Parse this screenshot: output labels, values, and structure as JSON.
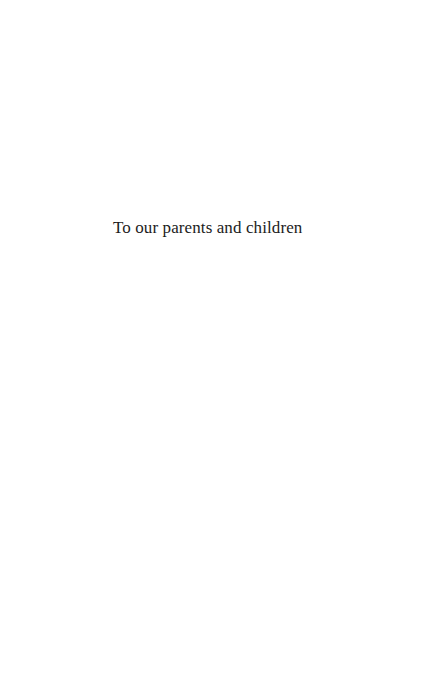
{
  "page": {
    "dedication": "To our parents and children"
  },
  "colors": {
    "background": "#ffffff",
    "text": "#1c1c1c"
  }
}
